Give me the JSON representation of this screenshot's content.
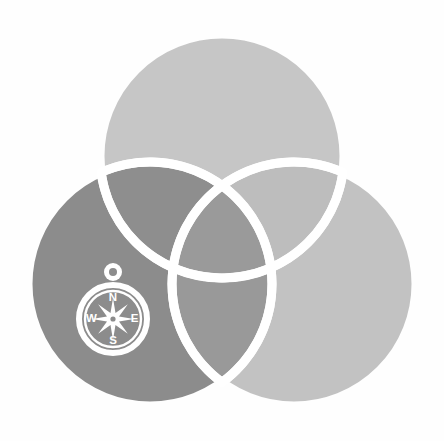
{
  "canvas": {
    "width": 444,
    "height": 441,
    "background_color": "#fefefe"
  },
  "artwork": {
    "title": "Three-circle Venn diagram with compass",
    "type": "logo-illustration",
    "stroke_color": "#ffffff",
    "stroke_width": 9
  },
  "circles": [
    {
      "id": "top",
      "name": "top-circle",
      "cx": 222,
      "cy": 156,
      "r": 122,
      "fill": "#c6c6c6"
    },
    {
      "id": "left",
      "name": "left-circle",
      "cx": 150,
      "cy": 284,
      "r": 122,
      "fill": "#8c8c8c"
    },
    {
      "id": "right",
      "name": "right-circle",
      "cx": 294,
      "cy": 284,
      "r": 122,
      "fill": "#c2c2c2"
    }
  ],
  "overlaps": {
    "top_left_fill": "#8e8e8e",
    "top_right_fill": "#bdbdbd",
    "left_right_fill": "#999999",
    "center_fill": "#9a9a9a"
  },
  "compass": {
    "name": "compass-icon",
    "cx": 113,
    "cy": 319,
    "case_radius": 37,
    "dial_radius": 28,
    "ring_loop": {
      "cx": 113,
      "cy": 272,
      "outer_r": 9,
      "inner_r": 4
    },
    "rose_points": 8,
    "rose_color": "#ffffff",
    "case_color": "#ffffff",
    "labels": {
      "north": "N",
      "east": "E",
      "south": "S",
      "west": "W"
    }
  }
}
